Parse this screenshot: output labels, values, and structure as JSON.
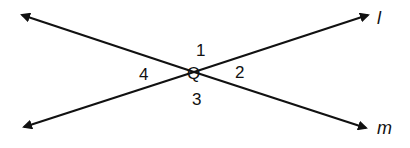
{
  "diagram": {
    "type": "intersecting-lines",
    "lines": [
      {
        "name": "l",
        "from": [
          24,
          127
        ],
        "to": [
          370,
          14
        ]
      },
      {
        "name": "m",
        "from": [
          22,
          14
        ],
        "to": [
          368,
          129
        ]
      }
    ],
    "intersection": {
      "label": "Q",
      "point": [
        194,
        72
      ]
    },
    "angles": [
      {
        "label": "1",
        "position": "top"
      },
      {
        "label": "2",
        "position": "right"
      },
      {
        "label": "3",
        "position": "bottom"
      },
      {
        "label": "4",
        "position": "left"
      }
    ],
    "line_labels": {
      "l": "l",
      "m": "m"
    },
    "stroke_color": "#111111"
  }
}
